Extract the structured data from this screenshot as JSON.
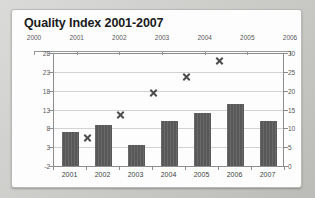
{
  "card": {
    "title": "Quality Index 2001-2007"
  },
  "chart_data": {
    "type": "bar",
    "title": "Quality Index 2001-2007",
    "xlabel": "",
    "ylabel": "",
    "grid": true,
    "legend": "none",
    "categories": [
      "2001",
      "2002",
      "2003",
      "2004",
      "2005",
      "2006",
      "2007"
    ],
    "series": [
      {
        "name": "Quality Index",
        "type": "bar",
        "axis": "left",
        "values": [
          7,
          9,
          3.5,
          10,
          12,
          14.5,
          10
        ]
      },
      {
        "name": "Trend",
        "type": "scatter",
        "axis": "right",
        "marker": "x-square",
        "x": [
          "2001",
          "2002",
          "2003",
          "2004",
          "2005"
        ],
        "values": [
          7.5,
          13.5,
          19.5,
          23.5,
          28
        ]
      }
    ],
    "axes": {
      "left": {
        "ticks": [
          -2,
          3,
          8,
          13,
          18,
          23,
          28
        ],
        "tick_labels": [
          "-2",
          "3",
          "8",
          "13",
          "18",
          "23",
          "28"
        ],
        "ylim": [
          -2,
          28
        ]
      },
      "right": {
        "ticks": [
          0,
          5,
          10,
          15,
          20,
          25,
          30
        ],
        "tick_labels": [
          "0",
          "5",
          "10",
          "15",
          "20",
          "25",
          "30"
        ],
        "ylim": [
          0,
          30
        ]
      },
      "top": {
        "tick_labels": [
          "2000",
          "2001",
          "2002",
          "2003",
          "2004",
          "2005",
          "2006"
        ]
      },
      "bottom": {
        "tick_labels": [
          "2001",
          "2002",
          "2003",
          "2004",
          "2005",
          "2006",
          "2007"
        ]
      }
    },
    "colors": {
      "bar": "#585858",
      "marker": "#4d4d4d",
      "grid": "#d2d2d2",
      "axis": "#8d8d8d",
      "plot_background": "#fdfdfd"
    }
  }
}
